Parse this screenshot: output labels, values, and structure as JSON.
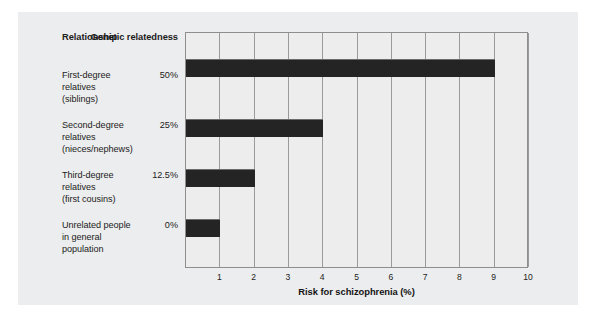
{
  "chart_data": {
    "type": "bar",
    "orientation": "horizontal",
    "title": "",
    "xlabel": "Risk for schizophrenia (%)",
    "ylabel": "",
    "xlim": [
      0,
      10
    ],
    "xticks": [
      "1",
      "2",
      "3",
      "4",
      "5",
      "6",
      "7",
      "8",
      "9",
      "10"
    ],
    "grid": "vertical",
    "legend": "none",
    "bar_color": "#242424",
    "plot_background": "#ededee",
    "categories": [
      "First-degree relatives (siblings)",
      "Second-degree relatives (nieces/nephews)",
      "Third-degree relatives (first cousins)",
      "Unrelated people in general population"
    ],
    "values": [
      9,
      4,
      2,
      1
    ],
    "annotations": {
      "genetic_relatedness": [
        "50%",
        "25%",
        "12.5%",
        "0%"
      ]
    }
  },
  "table": {
    "headers": {
      "relationship": "Relationship",
      "genetic_line1": "Genetic",
      "genetic_line2": "relatedness"
    },
    "rows": [
      {
        "line1": "First-degree",
        "line2": "relatives",
        "line3": "(siblings)",
        "pct": "50%",
        "value": 9
      },
      {
        "line1": "Second-degree",
        "line2": "relatives",
        "line3": "(nieces/nephews)",
        "pct": "25%",
        "value": 4
      },
      {
        "line1": "Third-degree",
        "line2": "relatives",
        "line3": "(first cousins)",
        "pct": "12.5%",
        "value": 2
      },
      {
        "line1": "Unrelated people",
        "line2": "in general",
        "line3": "population",
        "pct": "0%",
        "value": 1
      }
    ]
  },
  "axis": {
    "title": "Risk for schizophrenia (%)",
    "ticks": [
      "1",
      "2",
      "3",
      "4",
      "5",
      "6",
      "7",
      "8",
      "9",
      "10"
    ]
  }
}
